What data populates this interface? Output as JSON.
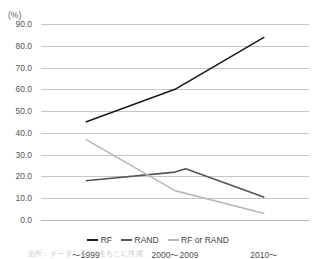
{
  "top_cut_text": {
    "left": "",
    "right": ""
  },
  "axes": {
    "unit_label": "(%)",
    "y_ticks": [
      "90.0",
      "80.0",
      "70.0",
      "60.0",
      "50.0",
      "40.0",
      "30.0",
      "20.0",
      "10.0",
      "0.0"
    ],
    "x_ticks": [
      "〜1999",
      "2000〜2009",
      "2010〜"
    ]
  },
  "legend": {
    "items": [
      {
        "label": "RF",
        "color": "#1a1a1a"
      },
      {
        "label": "RAND",
        "color": "#555555"
      },
      {
        "label": "RF or RAND",
        "color": "#b8b8b8"
      }
    ]
  },
  "source_note": "出所：データ：表7-1をもとに作成",
  "chart_data": {
    "type": "line",
    "title": "",
    "subtitle": "",
    "xlabel": "",
    "ylabel": "(%)",
    "ylim": [
      0,
      90
    ],
    "y_tick_step": 10,
    "grid": true,
    "legend_position": "bottom",
    "categories": [
      "〜1999",
      "2000〜2009",
      "2010〜"
    ],
    "series": [
      {
        "name": "RF",
        "color": "#1a1a1a",
        "values": [
          45.0,
          60.0,
          84.0
        ]
      },
      {
        "name": "RAND",
        "color": "#555555",
        "values": [
          18.0,
          22.0,
          10.5
        ],
        "peak_value": 23.5,
        "peak_position": 0.62
      },
      {
        "name": "RF or RAND",
        "color": "#b8b8b8",
        "values": [
          37.0,
          13.5,
          3.0
        ]
      }
    ]
  }
}
